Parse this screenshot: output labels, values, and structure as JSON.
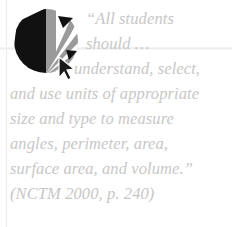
{
  "graphic": {
    "logo": {
      "name": "fan-burst-circle-logo",
      "colors": {
        "dark": "#111111",
        "mid_gray": "#9a9a9a",
        "light_gray": "#c9c9c9",
        "background": "#ffffff"
      },
      "cursor_icon_name": "mouse-pointer-arrow-icon"
    },
    "rules": {
      "vertical_color": "#ebebeb",
      "horizontal_color": "#ededed"
    }
  },
  "quote": {
    "text_color": "#c7c7c7",
    "lines": [
      "“All students",
      "should …",
      "understand, select,",
      "and use units of appropriate",
      "size and type to measure",
      "angles, perimeter, area,",
      "surface area, and volume.”",
      "(NCTM 2000, p. 240)"
    ],
    "full_text": "“All students should … understand, select, and use units of appropriate size and type to measure angles, perimeter, area, surface area, and volume.”",
    "citation": "(NCTM 2000, p. 240)",
    "source_organization": "NCTM",
    "source_year": "2000",
    "source_page": "p. 240"
  }
}
